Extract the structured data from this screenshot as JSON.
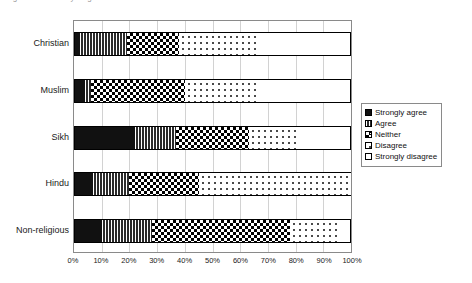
{
  "title_remnant": "Figure: Attitudes by religious affiliation",
  "axis": {
    "x_ticks": [
      "0%",
      "10%",
      "20%",
      "30%",
      "40%",
      "50%",
      "60%",
      "70%",
      "80%",
      "90%",
      "100%"
    ],
    "x_min": 0,
    "x_max": 100
  },
  "legend": {
    "items": [
      {
        "label": "Strongly agree",
        "pattern": "p-solid"
      },
      {
        "label": "Agree",
        "pattern": "p-vhatch"
      },
      {
        "label": "Neither",
        "pattern": "p-check"
      },
      {
        "label": "Disagree",
        "pattern": "p-dots"
      },
      {
        "label": "Strongly disagree",
        "pattern": "p-empty"
      }
    ]
  },
  "chart_data": {
    "type": "bar",
    "orientation": "horizontal",
    "stacked": true,
    "normalized_percent": true,
    "title": "",
    "xlabel": "",
    "ylabel": "",
    "xlim": [
      0,
      100
    ],
    "grid": true,
    "legend_position": "right",
    "categories": [
      "Christian",
      "Muslim",
      "Sikh",
      "Hindu",
      "Non-religious"
    ],
    "series": [
      {
        "name": "Strongly agree",
        "values": [
          2,
          4,
          22,
          7,
          10
        ]
      },
      {
        "name": "Agree",
        "values": [
          17,
          2,
          15,
          13,
          18
        ]
      },
      {
        "name": "Neither",
        "values": [
          19,
          34,
          26,
          25,
          50
        ]
      },
      {
        "name": "Disagree",
        "values": [
          29,
          26,
          17,
          55,
          17
        ]
      },
      {
        "name": "Strongly disagree",
        "values": [
          33,
          34,
          20,
          0,
          5
        ]
      }
    ]
  }
}
